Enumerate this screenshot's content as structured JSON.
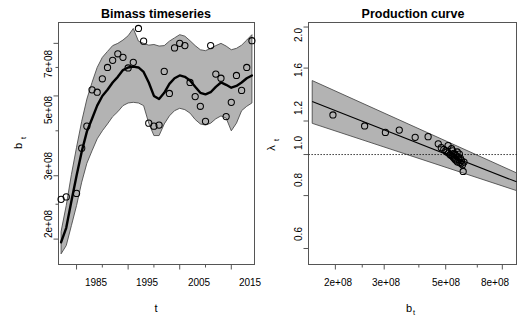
{
  "figure": {
    "width": 526,
    "height": 325,
    "background": "#ffffff",
    "panel_count": 2
  },
  "chart_data": [
    {
      "type": "line",
      "panel": "left",
      "title": "Bimass timeseries",
      "xlabel": "t",
      "ylabel": "b_t",
      "ylabel_display": "b",
      "ylabel_subscript": "t",
      "xscale": "linear",
      "yscale": "log",
      "xlim": [
        1981.5,
        2019.5
      ],
      "ylim": [
        170000000,
        800000000
      ],
      "grid": false,
      "legend": "none",
      "xticks": [
        1985,
        1995,
        2005,
        2015
      ],
      "xtick_labels": [
        "1985",
        "1995",
        "2005",
        "2015"
      ],
      "xminor_ticks": [
        1990,
        2000,
        2010
      ],
      "yticks": [
        200000000,
        300000000,
        500000000,
        700000000
      ],
      "ytick_labels": [
        "2e+08",
        "3e+08",
        "5e+08",
        "7e+08"
      ],
      "yminor_ticks": [
        250000000,
        400000000,
        600000000
      ],
      "series": [
        {
          "name": "median biomass",
          "style": "thick-black-line",
          "x": [
            1982,
            1983,
            1984,
            1985,
            1986,
            1987,
            1988,
            1989,
            1990,
            1991,
            1992,
            1993,
            1994,
            1995,
            1996,
            1997,
            1998,
            1999,
            2000,
            2001,
            2002,
            2003,
            2004,
            2005,
            2006,
            2007,
            2008,
            2009,
            2010,
            2011,
            2012,
            2013,
            2014,
            2015,
            2016,
            2017,
            2018,
            2019
          ],
          "y": [
            196000000,
            215000000,
            255000000,
            300000000,
            350000000,
            398000000,
            432000000,
            470000000,
            500000000,
            520000000,
            545000000,
            565000000,
            590000000,
            600000000,
            603000000,
            600000000,
            583000000,
            545000000,
            500000000,
            490000000,
            510000000,
            540000000,
            560000000,
            570000000,
            565000000,
            552000000,
            530000000,
            510000000,
            505000000,
            512000000,
            530000000,
            545000000,
            537000000,
            527000000,
            533000000,
            545000000,
            560000000,
            570000000
          ]
        },
        {
          "name": "95% credible interval upper",
          "style": "gray-band-edge",
          "x": [
            1982,
            1983,
            1984,
            1985,
            1986,
            1987,
            1988,
            1989,
            1990,
            1991,
            1992,
            1993,
            1994,
            1995,
            1996,
            1997,
            1998,
            1999,
            2000,
            2001,
            2002,
            2003,
            2004,
            2005,
            2006,
            2007,
            2008,
            2009,
            2010,
            2011,
            2012,
            2013,
            2014,
            2015,
            2016,
            2017,
            2018,
            2019
          ],
          "y": [
            210000000,
            248000000,
            302000000,
            360000000,
            425000000,
            490000000,
            545000000,
            600000000,
            640000000,
            665000000,
            690000000,
            700000000,
            715000000,
            735000000,
            770000000,
            710000000,
            700000000,
            692000000,
            695000000,
            688000000,
            690000000,
            710000000,
            725000000,
            740000000,
            733000000,
            712000000,
            690000000,
            672000000,
            668000000,
            678000000,
            690000000,
            700000000,
            688000000,
            672000000,
            678000000,
            692000000,
            715000000,
            740000000
          ]
        },
        {
          "name": "95% credible interval lower",
          "style": "gray-band-edge",
          "x": [
            1982,
            1983,
            1984,
            1985,
            1986,
            1987,
            1988,
            1989,
            1990,
            1991,
            1992,
            1993,
            1994,
            1995,
            1996,
            1997,
            1998,
            1999,
            2000,
            2001,
            2002,
            2003,
            2004,
            2005,
            2006,
            2007,
            2008,
            2009,
            2010,
            2011,
            2012,
            2013,
            2014,
            2015,
            2016,
            2017,
            2018,
            2019
          ],
          "y": [
            182000000,
            192000000,
            218000000,
            248000000,
            288000000,
            325000000,
            352000000,
            380000000,
            400000000,
            418000000,
            438000000,
            452000000,
            470000000,
            478000000,
            480000000,
            478000000,
            470000000,
            420000000,
            388000000,
            388000000,
            418000000,
            440000000,
            455000000,
            462000000,
            458000000,
            448000000,
            430000000,
            418000000,
            415000000,
            420000000,
            432000000,
            440000000,
            434000000,
            400000000,
            420000000,
            455000000,
            468000000,
            478000000
          ]
        },
        {
          "name": "observed biomass",
          "style": "open-circles",
          "x": [
            1982,
            1983,
            1985,
            1986,
            1987,
            1988,
            1989,
            1990,
            1991,
            1992,
            1993,
            1994,
            1995,
            1996,
            1997,
            1998,
            1999,
            2000,
            2001,
            2002,
            2003,
            2004,
            2005,
            2006,
            2007,
            2008,
            2009,
            2010,
            2011,
            2012,
            2013,
            2014,
            2015,
            2016,
            2017,
            2018,
            2019
          ],
          "y": [
            258000000,
            262000000,
            268000000,
            358000000,
            412000000,
            520000000,
            512000000,
            558000000,
            600000000,
            628000000,
            655000000,
            640000000,
            598000000,
            620000000,
            770000000,
            710000000,
            420000000,
            412000000,
            415000000,
            585000000,
            508000000,
            680000000,
            700000000,
            690000000,
            545000000,
            498000000,
            468000000,
            425000000,
            690000000,
            575000000,
            560000000,
            438000000,
            480000000,
            570000000,
            518000000,
            600000000,
            712000000
          ]
        }
      ]
    },
    {
      "type": "line",
      "panel": "right",
      "title": "Production curve",
      "xlabel": "b_t",
      "xlabel_display": "b",
      "xlabel_subscript": "t",
      "ylabel": "lambda_t",
      "ylabel_display": "λ",
      "ylabel_subscript": "t",
      "xscale": "log",
      "yscale": "log",
      "xlim": [
        160000000,
        900000000
      ],
      "ylim": [
        0.55,
        2.05
      ],
      "grid": false,
      "legend": "none",
      "xticks": [
        200000000,
        300000000,
        500000000,
        800000000
      ],
      "xtick_labels": [
        "2e+08",
        "3e+08",
        "5e+08",
        "8e+08"
      ],
      "xminor_ticks": [
        250000000,
        400000000,
        650000000
      ],
      "yticks": [
        0.6,
        0.8,
        1.0,
        1.2,
        1.6,
        2.0
      ],
      "ytick_labels": [
        "0.6",
        "0.8",
        "1.0",
        "1.2",
        "1.6",
        "2.0"
      ],
      "reference_line": {
        "y": 1.0,
        "style": "dotted"
      },
      "series": [
        {
          "name": "fitted production curve",
          "style": "thin-black-line",
          "x": [
            165000000,
            900000000
          ],
          "y": [
            1.335,
            0.862
          ]
        },
        {
          "name": "95% credible interval upper",
          "style": "gray-band-edge",
          "x": [
            165000000,
            900000000
          ],
          "y": [
            1.495,
            0.905
          ]
        },
        {
          "name": "95% credible interval lower",
          "style": "gray-band-edge",
          "x": [
            165000000,
            900000000
          ],
          "y": [
            1.185,
            0.822
          ]
        },
        {
          "name": "observed growth rates",
          "style": "open-circles",
          "x": [
            196000000,
            255000000,
            303000000,
            340000000,
            388000000,
            432000000,
            470000000,
            482000000,
            492000000,
            500000000,
            505000000,
            510000000,
            512000000,
            518000000,
            522000000,
            525000000,
            528000000,
            530000000,
            532000000,
            535000000,
            538000000,
            540000000,
            542000000,
            545000000,
            548000000,
            550000000,
            552000000,
            555000000,
            558000000,
            560000000,
            562000000,
            565000000,
            568000000,
            570000000,
            575000000,
            578000000,
            582000000
          ],
          "y": [
            1.24,
            1.168,
            1.128,
            1.142,
            1.098,
            1.102,
            1.06,
            1.038,
            1.028,
            1.022,
            1.014,
            1.05,
            1.008,
            1.0,
            0.996,
            1.032,
            0.992,
            1.02,
            0.986,
            1.006,
            0.978,
            1.0,
            0.972,
            0.994,
            0.966,
            1.014,
            0.96,
            0.986,
            0.974,
            1.002,
            0.958,
            0.98,
            0.952,
            0.968,
            0.946,
            0.912,
            0.96
          ]
        }
      ]
    }
  ],
  "panels": {
    "left": {
      "name": "biomass-timeseries-panel",
      "title": "Bimass timeseries",
      "x_axis_title": "t",
      "y_axis_title_base": "b",
      "y_axis_title_sub": "t",
      "x_tick_labels": [
        "1985",
        "1995",
        "2005",
        "2015"
      ],
      "y_tick_labels": [
        "2e+08",
        "3e+08",
        "5e+08",
        "7e+08"
      ]
    },
    "right": {
      "name": "production-curve-panel",
      "title": "Production curve",
      "x_axis_title_base": "b",
      "x_axis_title_sub": "t",
      "y_axis_title_base": "λ",
      "y_axis_title_sub": "t",
      "x_tick_labels": [
        "2e+08",
        "3e+08",
        "5e+08",
        "8e+08"
      ],
      "y_tick_labels": [
        "0.6",
        "0.8",
        "1.0",
        "1.2",
        "1.6",
        "2.0"
      ]
    }
  },
  "colors": {
    "band_fill": "#b3b3b3",
    "band_edge": "#4d4d4d",
    "line": "#000000",
    "frame": "#555555",
    "background": "#ffffff"
  }
}
